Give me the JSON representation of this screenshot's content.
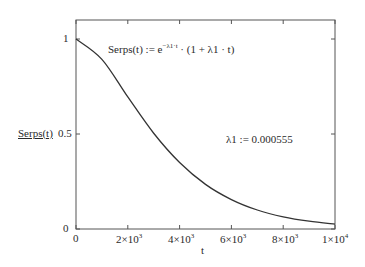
{
  "chart_data": {
    "type": "line",
    "title": "",
    "xlabel": "t",
    "ylabel": "Serps(t)",
    "xlim": [
      0,
      10000
    ],
    "ylim": [
      0,
      1.1
    ],
    "grid": false,
    "x_ticks": [
      0,
      2000,
      4000,
      6000,
      8000,
      10000
    ],
    "x_tick_labels": [
      "0",
      "2×10^3",
      "4×10^3",
      "6×10^3",
      "8×10^3",
      "1×10^4"
    ],
    "y_ticks": [
      0,
      0.5,
      1
    ],
    "y_tick_labels": [
      "0",
      "0.5",
      "1"
    ],
    "annotations": [
      "Serps(t) := e^(−λ1·t) · (1 + λ1 · t)",
      "λ1 := 0.000555"
    ],
    "series": [
      {
        "name": "Serps(t)",
        "x": [
          0,
          1000,
          2000,
          3000,
          4000,
          5000,
          6000,
          7000,
          8000,
          9000,
          10000
        ],
        "values": [
          1.0,
          0.893,
          0.695,
          0.504,
          0.35,
          0.235,
          0.155,
          0.1,
          0.064,
          0.041,
          0.026
        ]
      }
    ]
  },
  "labels": {
    "ylabel": "Serps(t)",
    "xlabel": "t",
    "formula_lhs": "Serps(t) := e",
    "formula_exp": "−λ1·t",
    "formula_rhs": " · (1 + λ1 · t)",
    "lambda_def": "λ1 := 0.000555",
    "y_ticks": [
      "0",
      "0.5",
      "1"
    ],
    "x_ticks": [
      {
        "base": "0",
        "exp": ""
      },
      {
        "base": "2×10",
        "exp": "3"
      },
      {
        "base": "4×10",
        "exp": "3"
      },
      {
        "base": "6×10",
        "exp": "3"
      },
      {
        "base": "8×10",
        "exp": "3"
      },
      {
        "base": "1×10",
        "exp": "4"
      }
    ]
  }
}
